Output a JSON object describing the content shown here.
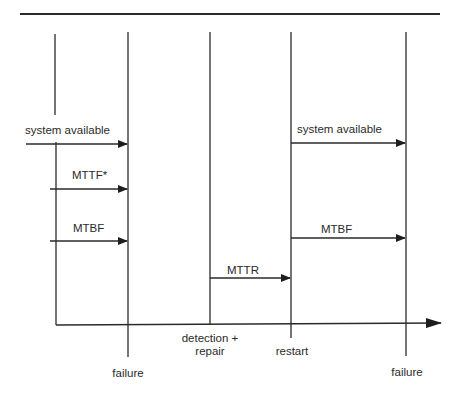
{
  "diagram": {
    "events": [
      {
        "id": "failure-1",
        "label_lines": [
          "failure"
        ]
      },
      {
        "id": "detection-repair",
        "label_lines": [
          "detection +",
          "repair"
        ]
      },
      {
        "id": "restart",
        "label_lines": [
          "restart"
        ]
      },
      {
        "id": "failure-2",
        "label_lines": [
          "failure"
        ]
      }
    ],
    "intervals": [
      {
        "id": "system-available-left",
        "label": "system available",
        "from": "start",
        "to": "failure-1"
      },
      {
        "id": "mttf",
        "label": "MTTF*",
        "from": "origin",
        "to": "failure-1"
      },
      {
        "id": "mtbf-left",
        "label": "MTBF",
        "from": "origin",
        "to": "failure-1"
      },
      {
        "id": "mttr",
        "label": "MTTR",
        "from": "detection-repair",
        "to": "restart"
      },
      {
        "id": "system-available-right",
        "label": "system available",
        "from": "restart",
        "to": "failure-2"
      },
      {
        "id": "mtbf-right",
        "label": "MTBF",
        "from": "restart",
        "to": "failure-2"
      }
    ],
    "axis": {
      "label": "time",
      "direction": "right"
    }
  }
}
